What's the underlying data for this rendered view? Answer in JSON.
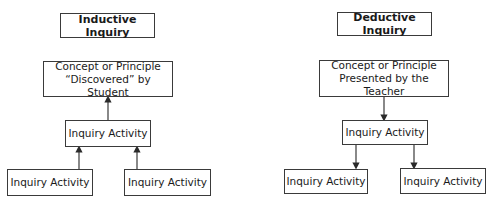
{
  "left": {
    "title": "Inductive Inquiry",
    "concept_line1": "Concept or Principle",
    "concept_line2": "“Discovered” by Student",
    "middle": "Inquiry Activity",
    "bottom_left": "Inquiry Activity",
    "bottom_right": "Inquiry Activity",
    "arrow_direction": "up"
  },
  "right": {
    "title": "Deductive Inquiry",
    "concept_line1": "Concept or Principle",
    "concept_line2": "Presented by the Teacher",
    "middle": "Inquiry Activity",
    "bottom_left": "Inquiry Activity",
    "bottom_right": "Inquiry Activity",
    "arrow_direction": "down"
  },
  "colors": {
    "line": "#3a3a3a",
    "background": "#ffffff"
  }
}
